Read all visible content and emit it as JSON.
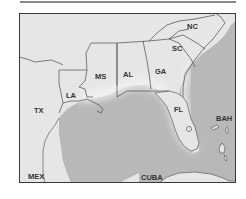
{
  "map": {
    "type": "regional map",
    "region": "Southeastern United States and Gulf of Mexico",
    "colors": {
      "land": "#e6e6e6",
      "water": "#b8b8b8",
      "border": "#4a4a4a",
      "frame": "#3a3a3a",
      "label": "#333333"
    },
    "labels": {
      "nc": "NC",
      "sc": "SC",
      "ga": "GA",
      "al": "AL",
      "ms": "MS",
      "la": "LA",
      "tx": "TX",
      "fl": "FL",
      "bah": "BAH",
      "mex": "MEX",
      "cuba": "CUBA"
    }
  }
}
